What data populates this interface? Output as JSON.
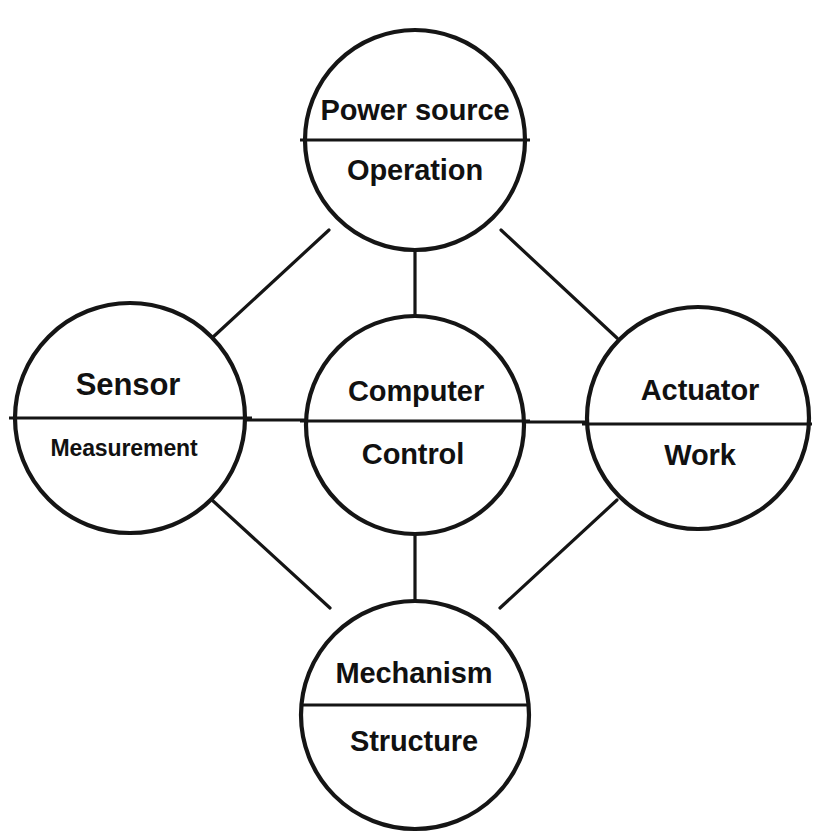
{
  "diagram": {
    "background_color": "#ffffff",
    "stroke_color": "#151515",
    "nodes": [
      {
        "id": "power-source",
        "position": "top",
        "top_label": "Power source",
        "bottom_label": "Operation",
        "cx": 415,
        "cy": 140,
        "r": 110,
        "divider_y": 140
      },
      {
        "id": "sensor",
        "position": "left",
        "top_label": "Sensor",
        "bottom_label": "Measurement",
        "cx": 130,
        "cy": 418,
        "r": 115,
        "divider_y": 418
      },
      {
        "id": "computer",
        "position": "center",
        "top_label": "Computer",
        "bottom_label": "Control",
        "cx": 415,
        "cy": 425,
        "r": 109,
        "divider_y": 421
      },
      {
        "id": "actuator",
        "position": "right",
        "top_label": "Actuator",
        "bottom_label": "Work",
        "cx": 698,
        "cy": 418,
        "r": 111,
        "divider_y": 424
      },
      {
        "id": "mechanism",
        "position": "bottom",
        "top_label": "Mechanism",
        "bottom_label": "Structure",
        "cx": 415,
        "cy": 715,
        "r": 114,
        "divider_y": 705
      }
    ],
    "connections": [
      {
        "id": "sensor-to-power-source",
        "from": "sensor",
        "to": "power-source"
      },
      {
        "id": "power-source-to-computer",
        "from": "power-source",
        "to": "computer"
      },
      {
        "id": "power-source-to-actuator",
        "from": "power-source",
        "to": "actuator"
      },
      {
        "id": "sensor-to-computer",
        "from": "sensor",
        "to": "computer"
      },
      {
        "id": "computer-to-actuator",
        "from": "computer",
        "to": "actuator"
      },
      {
        "id": "sensor-to-mechanism",
        "from": "sensor",
        "to": "mechanism"
      },
      {
        "id": "computer-to-mechanism",
        "from": "computer",
        "to": "mechanism"
      },
      {
        "id": "actuator-to-mechanism",
        "from": "actuator",
        "to": "mechanism"
      }
    ]
  }
}
